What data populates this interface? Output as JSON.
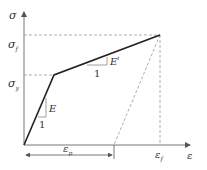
{
  "diagram": {
    "axes": {
      "y_label": "σ",
      "x_label": "ε"
    },
    "y_ticks": [
      {
        "symbol": "σ",
        "subscript": "f"
      },
      {
        "symbol": "σ",
        "subscript": "y"
      }
    ],
    "x_ticks": [
      {
        "symbol": "ε",
        "subscript": "f"
      }
    ],
    "dimension": {
      "symbol": "ε",
      "subscript": "p"
    },
    "slopes": [
      {
        "label": "E",
        "run": "1"
      },
      {
        "label": "E",
        "superscript": "t",
        "run": "1"
      }
    ],
    "colors": {
      "curve": "#222222",
      "axis": "#777777",
      "dashed": "#999999",
      "text": "#333333"
    }
  }
}
